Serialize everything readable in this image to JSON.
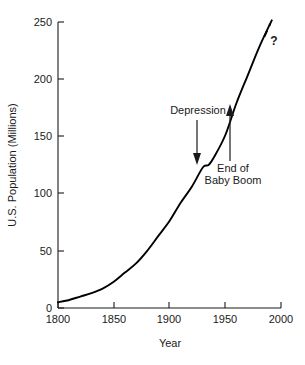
{
  "chart_data": {
    "type": "line",
    "title": "",
    "xlabel": "Year",
    "ylabel": "U.S. Population (Millions)",
    "xlim": [
      1800,
      2000
    ],
    "ylim": [
      0,
      250
    ],
    "grid": false,
    "legend": "none",
    "xticks": [
      1800,
      1850,
      1900,
      1950,
      2000
    ],
    "xtick_labels": [
      "1800",
      "1850",
      "1900",
      "1950",
      "2000"
    ],
    "yticks": [
      0,
      50,
      100,
      150,
      200,
      250
    ],
    "ytick_labels": [
      "0",
      "50",
      "100",
      "150",
      "200",
      "250"
    ],
    "series": [
      {
        "name": "U.S. Population (observed)",
        "style": "solid",
        "x": [
          1800,
          1810,
          1820,
          1830,
          1840,
          1850,
          1860,
          1870,
          1880,
          1890,
          1900,
          1910,
          1920,
          1930,
          1935,
          1940,
          1950,
          1960,
          1970,
          1980,
          1990
        ],
        "values": [
          5,
          7,
          10,
          13,
          17,
          23,
          31,
          39,
          50,
          63,
          76,
          92,
          106,
          123,
          125,
          132,
          151,
          179,
          203,
          227,
          248
        ]
      },
      {
        "name": "Projection",
        "style": "dashed",
        "x": [
          1985,
          1992
        ],
        "values": [
          237,
          252
        ]
      }
    ],
    "annotations": [
      {
        "id": "depression",
        "label": "Depression",
        "arrow": "down",
        "points_to_year": 1935,
        "points_to_value": 125
      },
      {
        "id": "end-of-baby-boom",
        "label_line1": "End of",
        "label_line2": "Baby Boom",
        "arrow": "up",
        "points_to_year": 1966,
        "points_to_value": 196
      },
      {
        "id": "question-mark",
        "label": "?"
      }
    ]
  }
}
